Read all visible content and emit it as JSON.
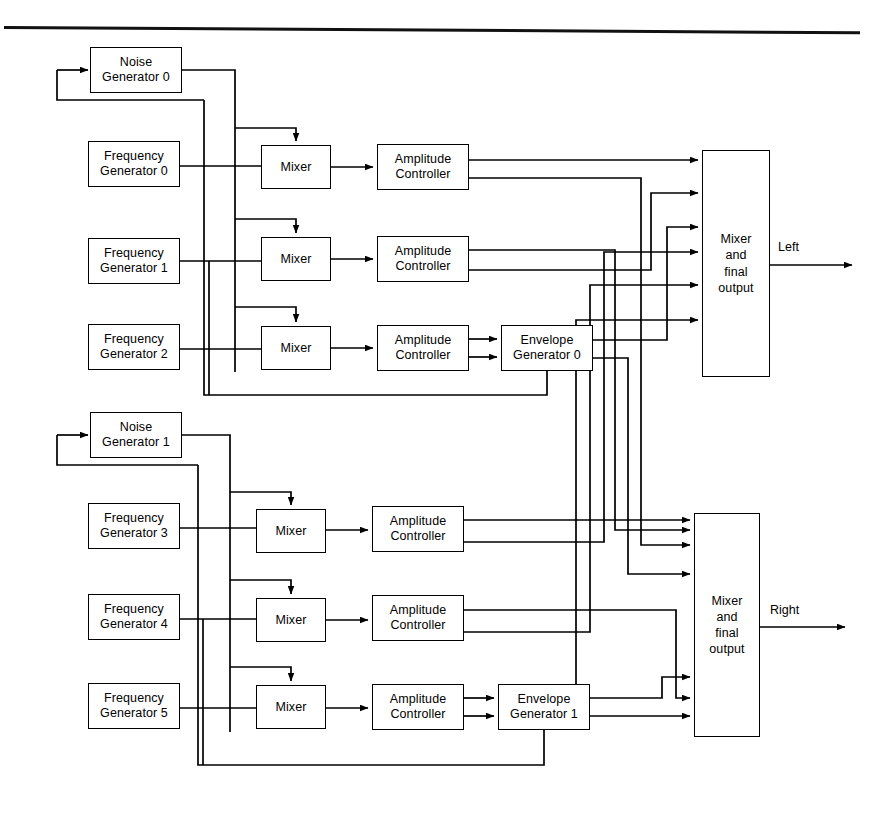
{
  "diagram": {
    "line_color": "#000000",
    "background": "#ffffff",
    "top_rule": true,
    "blocks": [
      {
        "id": "noise0",
        "label": "Noise\nGenerator 0",
        "x": 90,
        "y": 47,
        "w": 92,
        "h": 46
      },
      {
        "id": "freq0",
        "label": "Frequency\nGenerator 0",
        "x": 88,
        "y": 141,
        "w": 92,
        "h": 46
      },
      {
        "id": "freq1",
        "label": "Frequency\nGenerator 1",
        "x": 88,
        "y": 238,
        "w": 92,
        "h": 46
      },
      {
        "id": "freq2",
        "label": "Frequency\nGenerator 2",
        "x": 88,
        "y": 324,
        "w": 92,
        "h": 46
      },
      {
        "id": "mix0",
        "label": "Mixer",
        "x": 261,
        "y": 145,
        "w": 70,
        "h": 44
      },
      {
        "id": "mix1",
        "label": "Mixer",
        "x": 261,
        "y": 237,
        "w": 70,
        "h": 44
      },
      {
        "id": "mix2",
        "label": "Mixer",
        "x": 261,
        "y": 326,
        "w": 70,
        "h": 44
      },
      {
        "id": "amp0",
        "label": "Amplitude\nController",
        "x": 377,
        "y": 144,
        "w": 92,
        "h": 46
      },
      {
        "id": "amp1",
        "label": "Amplitude\nController",
        "x": 377,
        "y": 236,
        "w": 92,
        "h": 46
      },
      {
        "id": "amp2",
        "label": "Amplitude\nController",
        "x": 377,
        "y": 325,
        "w": 92,
        "h": 46
      },
      {
        "id": "env0",
        "label": "Envelope\nGenerator 0",
        "x": 501,
        "y": 325,
        "w": 92,
        "h": 46
      },
      {
        "id": "out0",
        "label": "Mixer\nand\nfinal\noutput",
        "x": 702,
        "y": 150,
        "w": 68,
        "h": 227
      },
      {
        "id": "noise1",
        "label": "Noise\nGenerator 1",
        "x": 90,
        "y": 412,
        "w": 92,
        "h": 46
      },
      {
        "id": "freq3",
        "label": "Frequency\nGenerator 3",
        "x": 88,
        "y": 503,
        "w": 92,
        "h": 46
      },
      {
        "id": "freq4",
        "label": "Frequency\nGenerator 4",
        "x": 88,
        "y": 594,
        "w": 92,
        "h": 46
      },
      {
        "id": "freq5",
        "label": "Frequency\nGenerator 5",
        "x": 88,
        "y": 683,
        "w": 92,
        "h": 46
      },
      {
        "id": "mix3",
        "label": "Mixer",
        "x": 256,
        "y": 509,
        "w": 70,
        "h": 44
      },
      {
        "id": "mix4",
        "label": "Mixer",
        "x": 256,
        "y": 598,
        "w": 70,
        "h": 44
      },
      {
        "id": "mix5",
        "label": "Mixer",
        "x": 256,
        "y": 685,
        "w": 70,
        "h": 44
      },
      {
        "id": "amp3",
        "label": "Amplitude\nController",
        "x": 372,
        "y": 506,
        "w": 92,
        "h": 46
      },
      {
        "id": "amp4",
        "label": "Amplitude\nController",
        "x": 372,
        "y": 595,
        "w": 92,
        "h": 46
      },
      {
        "id": "amp5",
        "label": "Amplitude\nController",
        "x": 372,
        "y": 684,
        "w": 92,
        "h": 46
      },
      {
        "id": "env1",
        "label": "Envelope\nGenerator 1",
        "x": 498,
        "y": 684,
        "w": 92,
        "h": 46
      },
      {
        "id": "out1",
        "label": "Mixer\nand\nfinal\noutput",
        "x": 694,
        "y": 513,
        "w": 66,
        "h": 224
      }
    ],
    "output_labels": [
      {
        "id": "left",
        "text": "Left",
        "x": 778,
        "y": 240
      },
      {
        "id": "right",
        "text": "Right",
        "x": 770,
        "y": 603
      }
    ]
  }
}
